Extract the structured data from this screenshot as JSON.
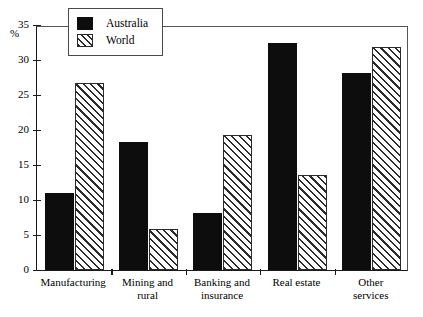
{
  "chart_data": {
    "type": "bar",
    "title": "",
    "xlabel": "",
    "ylabel": "%",
    "ylim": [
      0,
      35
    ],
    "yticks": [
      0,
      5,
      10,
      15,
      20,
      25,
      30,
      35
    ],
    "grid": false,
    "legend_position": "top-left",
    "categories": [
      "Manufacturing",
      "Mining and\nrural",
      "Banking and\ninsurance",
      "Real estate",
      "Other\nservices"
    ],
    "series": [
      {
        "name": "Australia",
        "color": "#0d0d0d",
        "fill": "solid",
        "values": [
          11.0,
          18.3,
          8.2,
          32.4,
          28.2
        ]
      },
      {
        "name": "World",
        "color": "#2b2b2b",
        "fill": "diagonal-hatch",
        "values": [
          26.7,
          5.8,
          19.3,
          13.6,
          31.8
        ]
      }
    ]
  },
  "legend": {
    "items": [
      {
        "label": "Australia",
        "swatch": "solid-black-square"
      },
      {
        "label": "World",
        "swatch": "hatched-square"
      }
    ]
  },
  "axis": {
    "unit_label": "%"
  }
}
